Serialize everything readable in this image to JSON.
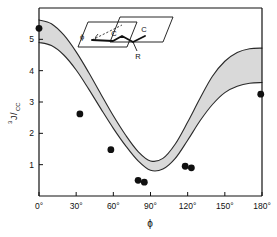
{
  "chart_data": {
    "type": "line",
    "title": "",
    "xlabel": "ϕ",
    "ylabel": "3J/CC",
    "ylabel_superscript": "3",
    "ylabel_main": "J",
    "ylabel_subscript": "CC",
    "xlim": [
      0,
      180
    ],
    "ylim": [
      0,
      6.0
    ],
    "grid": false,
    "legend": null,
    "xticks": [
      0,
      30,
      60,
      90,
      120,
      150,
      180
    ],
    "xticklabels": [
      "0°",
      "30°",
      "60°",
      "90°",
      "120°",
      "150°",
      "180°"
    ],
    "yticks": [
      1,
      2,
      3,
      4,
      5
    ],
    "yticklabels": [
      "1",
      "2",
      "3",
      "4",
      "5"
    ],
    "series": [
      {
        "name": "Karplus band upper bound",
        "type": "line",
        "x": [
          0,
          10,
          20,
          30,
          40,
          50,
          60,
          70,
          80,
          90,
          100,
          110,
          120,
          130,
          140,
          150,
          160,
          170,
          180
        ],
        "values": [
          5.62,
          5.5,
          5.14,
          4.6,
          3.95,
          3.25,
          2.56,
          1.94,
          1.42,
          1.12,
          1.2,
          1.66,
          2.36,
          3.12,
          3.82,
          4.3,
          4.58,
          4.7,
          4.72
        ]
      },
      {
        "name": "Karplus band lower bound",
        "type": "line",
        "x": [
          0,
          10,
          20,
          30,
          40,
          50,
          60,
          70,
          80,
          90,
          100,
          110,
          120,
          130,
          140,
          150,
          160,
          170,
          180
        ],
        "values": [
          4.9,
          4.8,
          4.5,
          4.02,
          3.42,
          2.78,
          2.16,
          1.6,
          1.12,
          0.82,
          0.86,
          1.2,
          1.78,
          2.4,
          2.92,
          3.3,
          3.5,
          3.6,
          3.62
        ]
      },
      {
        "name": "Experimental data points",
        "type": "scatter",
        "points": [
          {
            "x": 0,
            "y": 5.35
          },
          {
            "x": 33,
            "y": 2.62
          },
          {
            "x": 58,
            "y": 1.48
          },
          {
            "x": 80,
            "y": 0.5
          },
          {
            "x": 85,
            "y": 0.44
          },
          {
            "x": 118,
            "y": 0.95
          },
          {
            "x": 123,
            "y": 0.9
          },
          {
            "x": 179,
            "y": 3.25
          }
        ]
      }
    ],
    "shaded_band": {
      "between": [
        "Karplus band upper bound",
        "Karplus band lower bound"
      ],
      "color": "#d9d9d9"
    }
  },
  "inset": {
    "name": "dihedral-angle-diagram",
    "labels": {
      "angle": "ϕ",
      "atom_left": "C",
      "atom_right": "C",
      "substituent": "R"
    }
  },
  "colors": {
    "axis": "#111111",
    "curve": "#2a2a2a",
    "band_fill": "#d9d9d9",
    "marker": "#101010",
    "background": "#ffffff"
  }
}
